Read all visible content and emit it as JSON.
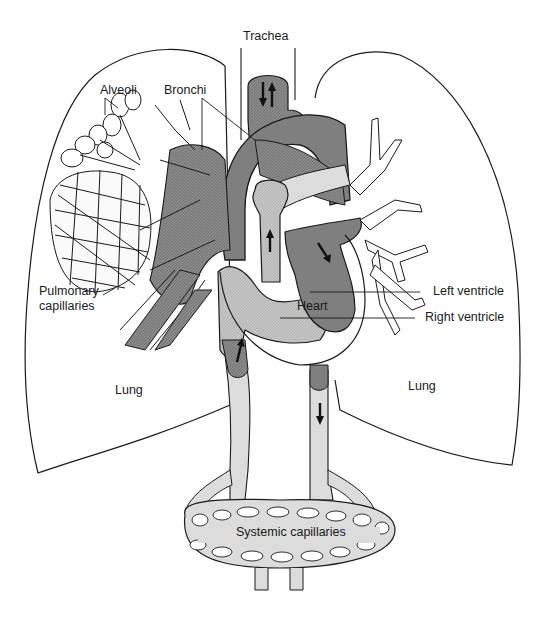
{
  "diagram": {
    "type": "anatomical-illustration",
    "colors": {
      "background": "#ffffff",
      "outline": "#1a1a1a",
      "deoxygenated_dark": "#7d7d7d",
      "deoxygenated_hatched": "#8c8c8c",
      "light_vessel": "#d9d9d9",
      "medium_gray": "#a8a8a8"
    },
    "labels": {
      "trachea": "Trachea",
      "alveoli": "Alveoli",
      "bronchi": "Bronchi",
      "pulmonary_capillaries_line1": "Pulmonary",
      "pulmonary_capillaries_line2": "capillaries",
      "lung_left": "Lung",
      "lung_right": "Lung",
      "heart": "Heart",
      "left_ventricle": "Left ventricle",
      "right_ventricle": "Right ventricle",
      "systemic_capillaries": "Systemic capillaries"
    },
    "arrows": [
      {
        "name": "trachea-down-arrow",
        "direction": "down"
      },
      {
        "name": "trachea-up-arrow",
        "direction": "up"
      },
      {
        "name": "pulmonary-artery-arrow",
        "direction": "up"
      },
      {
        "name": "left-atrium-arrow",
        "direction": "down-right"
      },
      {
        "name": "vena-cava-arrow",
        "direction": "up"
      },
      {
        "name": "aorta-descending-arrow",
        "direction": "down"
      }
    ]
  }
}
